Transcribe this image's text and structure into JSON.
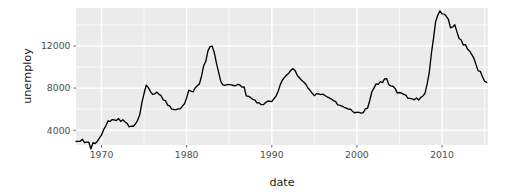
{
  "figure": {
    "background_color": "#ffffff",
    "panel_background_color": "#ebebeb",
    "grid_color": "#ffffff",
    "line_color": "#000000",
    "tick_text_color": "#4d4d4d",
    "title_text_color": "#1a1a1a"
  },
  "axes": {
    "x_title": "date",
    "y_title": "unemploy",
    "x_ticks": [
      "1970",
      "1980",
      "1990",
      "2000",
      "2010"
    ],
    "y_ticks": [
      "4000",
      "8000",
      "12000"
    ]
  },
  "chart_data": {
    "type": "line",
    "title": "",
    "subtitle": "",
    "xlabel": "date",
    "ylabel": "unemploy",
    "xlim": [
      1967.0,
      2015.4
    ],
    "ylim": [
      2600,
      15600
    ],
    "grid": true,
    "legend": "none",
    "xtick_values": [
      1970,
      1980,
      1990,
      2000,
      2010
    ],
    "xtick_labels": [
      "1970",
      "1980",
      "1990",
      "2000",
      "2010"
    ],
    "ytick_values": [
      4000,
      8000,
      12000
    ],
    "ytick_labels": [
      "4000",
      "8000",
      "12000"
    ],
    "minor_gridlines_x": [
      1965,
      1975,
      1985,
      1995,
      2005,
      2015
    ],
    "minor_gridlines_y": [
      2000,
      6000,
      10000,
      14000
    ],
    "series": [
      {
        "name": "unemploy",
        "color": "#000000",
        "x": [
          1967.0,
          1967.25,
          1967.5,
          1967.75,
          1968.0,
          1968.25,
          1968.5,
          1968.75,
          1969.0,
          1969.25,
          1969.5,
          1969.75,
          1970.0,
          1970.25,
          1970.5,
          1970.75,
          1971.0,
          1971.25,
          1971.5,
          1971.75,
          1972.0,
          1972.25,
          1972.5,
          1972.75,
          1973.0,
          1973.25,
          1973.5,
          1973.75,
          1974.0,
          1974.25,
          1974.5,
          1974.75,
          1975.0,
          1975.25,
          1975.5,
          1975.75,
          1976.0,
          1976.25,
          1976.5,
          1976.75,
          1977.0,
          1977.25,
          1977.5,
          1977.75,
          1978.0,
          1978.25,
          1978.5,
          1978.75,
          1979.0,
          1979.25,
          1979.5,
          1979.75,
          1980.0,
          1980.25,
          1980.5,
          1980.75,
          1981.0,
          1981.25,
          1981.5,
          1981.75,
          1982.0,
          1982.25,
          1982.5,
          1982.75,
          1983.0,
          1983.25,
          1983.5,
          1983.75,
          1984.0,
          1984.25,
          1984.5,
          1984.75,
          1985.0,
          1985.25,
          1985.5,
          1985.75,
          1986.0,
          1986.25,
          1986.5,
          1986.75,
          1987.0,
          1987.25,
          1987.5,
          1987.75,
          1988.0,
          1988.25,
          1988.5,
          1988.75,
          1989.0,
          1989.25,
          1989.5,
          1989.75,
          1990.0,
          1990.25,
          1990.5,
          1990.75,
          1991.0,
          1991.25,
          1991.5,
          1991.75,
          1992.0,
          1992.25,
          1992.5,
          1992.75,
          1993.0,
          1993.25,
          1993.5,
          1993.75,
          1994.0,
          1994.25,
          1994.5,
          1994.75,
          1995.0,
          1995.25,
          1995.5,
          1995.75,
          1996.0,
          1996.25,
          1996.5,
          1996.75,
          1997.0,
          1997.25,
          1997.5,
          1997.75,
          1998.0,
          1998.25,
          1998.5,
          1998.75,
          1999.0,
          1999.25,
          1999.5,
          1999.75,
          2000.0,
          2000.25,
          2000.5,
          2000.75,
          2001.0,
          2001.25,
          2001.5,
          2001.75,
          2002.0,
          2002.25,
          2002.5,
          2002.75,
          2003.0,
          2003.25,
          2003.5,
          2003.75,
          2004.0,
          2004.25,
          2004.5,
          2004.75,
          2005.0,
          2005.25,
          2005.5,
          2005.75,
          2006.0,
          2006.25,
          2006.5,
          2006.75,
          2007.0,
          2007.25,
          2007.5,
          2007.75,
          2008.0,
          2008.25,
          2008.5,
          2008.75,
          2009.0,
          2009.25,
          2009.5,
          2009.75,
          2010.0,
          2010.25,
          2010.5,
          2010.75,
          2011.0,
          2011.25,
          2011.5,
          2011.75,
          2012.0,
          2012.25,
          2012.5,
          2012.75,
          2013.0,
          2013.25,
          2013.5,
          2013.75,
          2014.0,
          2014.25,
          2014.5,
          2014.75,
          2015.0,
          2015.25
        ],
        "y": [
          2944,
          2945,
          2958,
          3143,
          2816,
          2868,
          2878,
          2227,
          2815,
          2740,
          2938,
          3253,
          3550,
          4060,
          4403,
          4875,
          4838,
          5011,
          4987,
          4914,
          5107,
          4837,
          4991,
          4810,
          4646,
          4319,
          4394,
          4380,
          4618,
          4952,
          5515,
          6636,
          7507,
          8266,
          8047,
          7666,
          7406,
          7459,
          7619,
          7404,
          7279,
          6876,
          6816,
          6390,
          6311,
          6007,
          5970,
          5951,
          6021,
          6026,
          6292,
          6519,
          7083,
          7807,
          7718,
          7644,
          8005,
          8224,
          8400,
          9149,
          10127,
          10544,
          11534,
          11930,
          11986,
          11350,
          10372,
          9516,
          8652,
          8305,
          8249,
          8341,
          8327,
          8310,
          8248,
          8222,
          8357,
          8294,
          8093,
          8120,
          7255,
          7226,
          7114,
          6937,
          6876,
          6601,
          6620,
          6430,
          6427,
          6617,
          6752,
          6763,
          6711,
          6992,
          7239,
          7695,
          8332,
          8766,
          9011,
          9236,
          9420,
          9705,
          9842,
          9643,
          9201,
          8981,
          8736,
          8577,
          8365,
          8005,
          7789,
          7508,
          7284,
          7473,
          7449,
          7374,
          7425,
          7296,
          7175,
          7069,
          6960,
          6811,
          6720,
          6410,
          6351,
          6289,
          6179,
          6103,
          6004,
          5993,
          5791,
          5639,
          5708,
          5692,
          5618,
          5665,
          6023,
          6089,
          6800,
          7626,
          8003,
          8402,
          8356,
          8613,
          8520,
          8867,
          8900,
          8316,
          8205,
          8174,
          7946,
          7524,
          7584,
          7524,
          7406,
          7327,
          7027,
          7031,
          6970,
          6885,
          7064,
          6876,
          7106,
          7257,
          7490,
          8396,
          9459,
          11286,
          12723,
          14326,
          14921,
          15324,
          15042,
          15026,
          14814,
          14512,
          13725,
          13803,
          14013,
          13333,
          12712,
          12568,
          12080,
          12129,
          11679,
          11505,
          11174,
          10814,
          10202,
          9635,
          9593,
          9070,
          8655,
          8540
        ]
      }
    ]
  }
}
